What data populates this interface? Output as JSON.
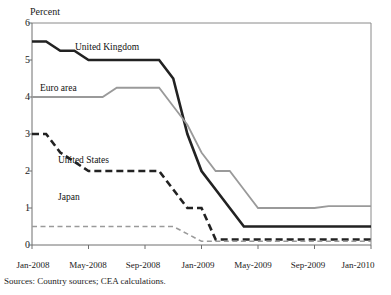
{
  "chart_data": {
    "type": "line",
    "title": "",
    "ylabel": "Percent",
    "xlabel": "",
    "ylim": [
      0,
      6
    ],
    "yticks": [
      "0",
      "1",
      "2",
      "3",
      "4",
      "5",
      "6"
    ],
    "ytick_values": [
      0,
      1,
      2,
      3,
      4,
      5,
      6
    ],
    "xticks": [
      "Jan-2008",
      "May-2008",
      "Sep-2008",
      "Jan-2009",
      "May-2009",
      "Sep-2009",
      "Jan-2010"
    ],
    "xtick_values": [
      0,
      4,
      8,
      12,
      16,
      20,
      24
    ],
    "xlim": [
      0,
      24
    ],
    "grid": false,
    "legend_position": "inline-annotations",
    "series": [
      {
        "name": "United Kingdom",
        "style": "solid",
        "color": "#222222",
        "width": 2.6,
        "x": [
          0,
          1,
          2,
          3,
          4,
          5,
          6,
          7,
          8,
          9,
          10,
          11,
          12,
          13,
          14,
          15,
          16,
          17,
          18,
          19,
          20,
          21,
          22,
          23,
          24
        ],
        "values": [
          5.5,
          5.5,
          5.25,
          5.25,
          5.0,
          5.0,
          5.0,
          5.0,
          5.0,
          5.0,
          4.5,
          3.0,
          2.0,
          1.5,
          1.0,
          0.5,
          0.5,
          0.5,
          0.5,
          0.5,
          0.5,
          0.5,
          0.5,
          0.5,
          0.5
        ]
      },
      {
        "name": "Euro area",
        "style": "solid",
        "color": "#9a9a9a",
        "width": 1.8,
        "x": [
          0,
          1,
          2,
          3,
          4,
          5,
          6,
          7,
          8,
          9,
          10,
          11,
          12,
          13,
          14,
          15,
          16,
          17,
          18,
          19,
          20,
          21,
          22,
          23,
          24
        ],
        "values": [
          4.0,
          4.0,
          4.0,
          4.0,
          4.0,
          4.0,
          4.25,
          4.25,
          4.25,
          4.25,
          3.75,
          3.25,
          2.5,
          2.0,
          2.0,
          1.5,
          1.0,
          1.0,
          1.0,
          1.0,
          1.0,
          1.05,
          1.05,
          1.05,
          1.05
        ]
      },
      {
        "name": "United States",
        "style": "dashed",
        "color": "#222222",
        "width": 2.6,
        "x": [
          0,
          1,
          2,
          3,
          4,
          5,
          6,
          7,
          8,
          9,
          10,
          11,
          12,
          13,
          14,
          15,
          16,
          17,
          18,
          19,
          20,
          21,
          22,
          23,
          24
        ],
        "values": [
          3.0,
          3.0,
          2.5,
          2.25,
          2.0,
          2.0,
          2.0,
          2.0,
          2.0,
          2.0,
          1.5,
          1.0,
          1.0,
          0.15,
          0.15,
          0.15,
          0.15,
          0.15,
          0.15,
          0.15,
          0.15,
          0.15,
          0.15,
          0.15,
          0.15
        ]
      },
      {
        "name": "Japan",
        "style": "dashed",
        "color": "#9a9a9a",
        "width": 1.6,
        "x": [
          0,
          1,
          2,
          3,
          4,
          5,
          6,
          7,
          8,
          9,
          10,
          11,
          12,
          13,
          14,
          15,
          16,
          17,
          18,
          19,
          20,
          21,
          22,
          23,
          24
        ],
        "values": [
          0.5,
          0.5,
          0.5,
          0.5,
          0.5,
          0.5,
          0.5,
          0.5,
          0.5,
          0.5,
          0.5,
          0.3,
          0.1,
          0.1,
          0.1,
          0.1,
          0.1,
          0.1,
          0.1,
          0.1,
          0.1,
          0.1,
          0.1,
          0.1,
          0.1
        ]
      }
    ],
    "annotations": [
      {
        "text": "United Kingdom",
        "series": "United Kingdom"
      },
      {
        "text": "Euro area",
        "series": "Euro area"
      },
      {
        "text": "United States",
        "series": "United States"
      },
      {
        "text": "Japan",
        "series": "Japan"
      }
    ],
    "source_note": "Sources:  Country sources; CEA calculations."
  },
  "colors": {
    "axis": "#6f6f6f",
    "frame": "#8a8a8a",
    "dark_series": "#222222",
    "light_series": "#9a9a9a",
    "text": "#1a1a1a",
    "background": "#ffffff"
  }
}
